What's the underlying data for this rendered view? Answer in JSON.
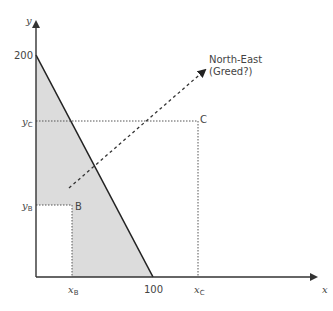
{
  "diagram": {
    "axes": {
      "x_label": "x",
      "y_label": "y",
      "x_intercept_label": "100",
      "y_intercept_label": "200"
    },
    "points": [
      {
        "name": "B",
        "x_label": "x",
        "x_sub": "B",
        "y_label": "y",
        "y_sub": "B"
      },
      {
        "name": "C",
        "x_label": "x",
        "x_sub": "C",
        "y_label": "y",
        "y_sub": "C"
      }
    ],
    "arrow": {
      "label_line1": "North-East",
      "label_line2": "(Greed?)"
    },
    "colors": {
      "shaded_region": "#dcdcdc",
      "axis": "#333333",
      "budget_line": "#222222",
      "dotted": "#555555"
    }
  }
}
